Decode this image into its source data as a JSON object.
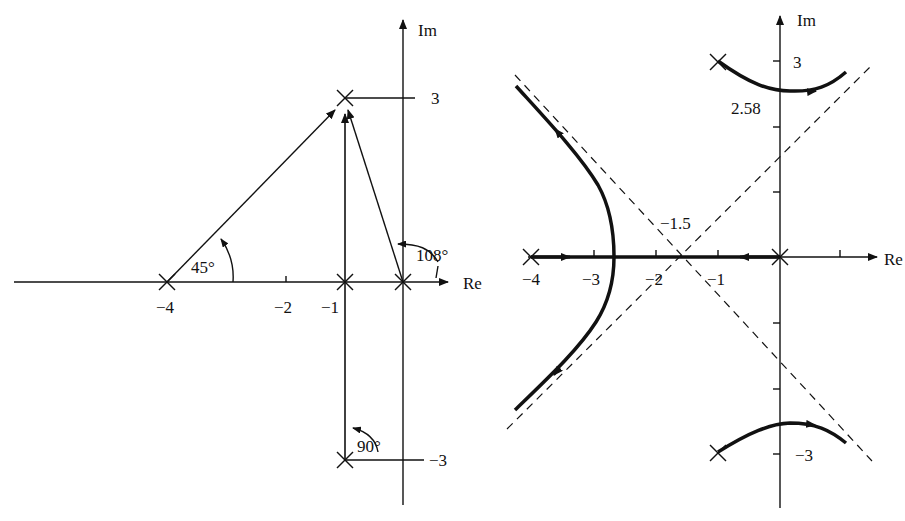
{
  "left_diagram": {
    "axis_labels": {
      "re": "Re",
      "im": "Im"
    },
    "re_ticks": [
      "−4",
      "−2",
      "−1"
    ],
    "im_ticks": [
      "3",
      "−3"
    ],
    "angles": [
      "45°",
      "108°",
      "90°"
    ],
    "poles": [
      {
        "re": -4,
        "im": 0
      },
      {
        "re": -1,
        "im": 0
      },
      {
        "re": 0,
        "im": 0
      },
      {
        "re": -1,
        "im": 3
      },
      {
        "re": -1,
        "im": -3
      }
    ],
    "test_point": {
      "re": -1,
      "im": 3
    }
  },
  "right_diagram": {
    "axis_labels": {
      "re": "Re",
      "im": "Im"
    },
    "re_ticks": [
      "−4",
      "−3",
      "−2",
      "−1"
    ],
    "im_ticks": [
      "3",
      "−3"
    ],
    "annotations": {
      "centroid": "−1.5",
      "crossing": "2.58"
    },
    "poles": [
      {
        "re": -4,
        "im": 0
      },
      {
        "re": 0,
        "im": 0
      },
      {
        "re": -1,
        "im": 3
      },
      {
        "re": -1,
        "im": -3
      }
    ],
    "asymptote_center": -1.5,
    "jw_crossing": 2.58
  }
}
